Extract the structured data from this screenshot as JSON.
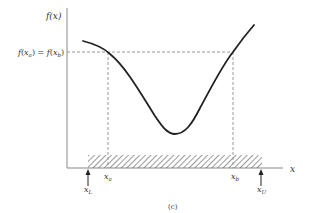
{
  "figure": {
    "caption": "(c)",
    "y_axis_label": "f(x)",
    "x_axis_label": "x",
    "level_label": "f(x_a) = f(x_b)",
    "level_label_parts": {
      "f1": "f",
      "open1": "(",
      "x1": "x",
      "sub1": "a",
      "close1": ")",
      "eq": " = ",
      "f2": "f",
      "open2": "(",
      "x2": "x",
      "sub2": "b",
      "close2": ")"
    },
    "points": {
      "x_a": {
        "base": "x",
        "sub": "a"
      },
      "x_b": {
        "base": "x",
        "sub": "b"
      },
      "x_L": {
        "base": "x",
        "sub": "L"
      },
      "x_U": {
        "base": "x",
        "sub": "U"
      }
    },
    "colors": {
      "curve": "#222222",
      "axes": "#888888",
      "dashed": "#999999",
      "hatch": "#555555"
    }
  }
}
